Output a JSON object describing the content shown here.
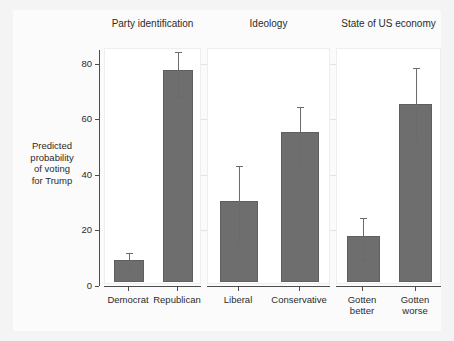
{
  "chart_data": {
    "type": "bar",
    "title": "",
    "xlabel": "",
    "ylabel": "Predicted\nprobability\nof voting\nfor Trump",
    "ylim": [
      0,
      85
    ],
    "yticks": [
      0,
      20,
      40,
      60,
      80
    ],
    "ytick_labels": [
      "0",
      "20",
      "40",
      "60",
      "80"
    ],
    "grid": true,
    "legend": "none",
    "panels": [
      {
        "title": "Party identification",
        "categories": [
          "Democrat",
          "Republican"
        ],
        "values": [
          7.8,
          76.2
        ],
        "ci_low": [
          4.5,
          68.0
        ],
        "ci_high": [
          11.5,
          84.0
        ]
      },
      {
        "title": "Ideology",
        "categories": [
          "Liberal",
          "Conservative"
        ],
        "values": [
          29.0,
          54.0
        ],
        "ci_low": [
          15.0,
          42.8
        ],
        "ci_high": [
          42.8,
          64.0
        ]
      },
      {
        "title": "State of US economy",
        "categories": [
          "Gotten\nbetter",
          "Gotten\nworse"
        ],
        "values": [
          16.6,
          64.0
        ],
        "ci_low": [
          9.0,
          51.0
        ],
        "ci_high": [
          24.0,
          78.0
        ]
      }
    ],
    "colors": {
      "bar_fill": "#6e6e6e",
      "bar_edge": "#5f5f5f",
      "error_bar": "#6b6b6b",
      "axis": "#4d4d4d",
      "grid": "#e3e3e3",
      "panel_background": "#ffffff",
      "figure_background": "#f4f4f4",
      "text": "#2b2b2b"
    }
  }
}
